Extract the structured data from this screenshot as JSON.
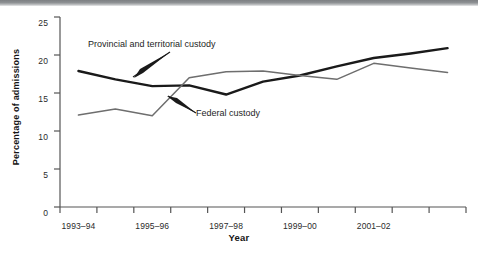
{
  "figure": {
    "y_axis_title": "Percentage of admissions",
    "x_axis_title": "Year"
  },
  "annotations": {
    "provincial": "Provincial and territorial custody",
    "federal": "Federal custody"
  },
  "axis": {
    "y_ticks": [
      "0",
      "5",
      "10",
      "15",
      "20",
      "25"
    ],
    "x_ticks": [
      "1993–94",
      "1995–96",
      "1997–98",
      "1999–00",
      "2001–02"
    ]
  },
  "colors": {
    "provincial_line": "#1a1a1a",
    "federal_line": "#6e6e6e",
    "axis": "#555555",
    "text": "#1e1e1e",
    "background": "#ffffff",
    "top_bar": "#85888b"
  },
  "chart_data": {
    "type": "line",
    "title": "",
    "xlabel": "Year",
    "ylabel": "Percentage of admissions",
    "ylim": [
      0,
      25
    ],
    "yticks": [
      0,
      5,
      10,
      15,
      20,
      25
    ],
    "grid": false,
    "legend_position": "inline-annotation",
    "x": [
      "1993–94",
      "1994–95",
      "1995–96",
      "1996–97",
      "1997–98",
      "1998–99",
      "1999–00",
      "2000–01",
      "2001–02",
      "2002–03",
      "2003–04"
    ],
    "x_tick_labels": [
      "1993–94",
      "1995–96",
      "1997–98",
      "1999–00",
      "2001–02"
    ],
    "series": [
      {
        "name": "Provincial and territorial custody",
        "color": "#1a1a1a",
        "line_width": 2.4,
        "values": [
          17.9,
          16.8,
          15.9,
          16.0,
          14.8,
          16.5,
          17.3,
          18.5,
          19.6,
          20.2,
          20.9
        ]
      },
      {
        "name": "Federal custody",
        "color": "#6e6e6e",
        "line_width": 1.5,
        "values": [
          12.1,
          12.9,
          12.0,
          17.0,
          17.8,
          17.9,
          17.3,
          16.8,
          18.9,
          18.3,
          17.7
        ]
      }
    ]
  }
}
